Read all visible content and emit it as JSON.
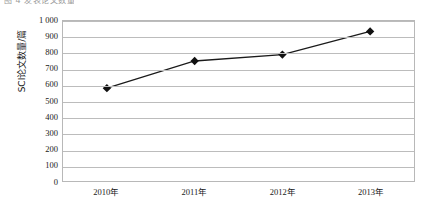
{
  "document": {
    "top_fragment_text": "图 4 发表论文数量"
  },
  "chart_data": {
    "type": "line",
    "title": "",
    "subtitle": "",
    "xlabel": "",
    "ylabel": "SCI论文数量/篇",
    "categories": [
      "2010年",
      "2011年",
      "2012年",
      "2013年"
    ],
    "values": [
      580,
      750,
      790,
      935
    ],
    "series": [
      {
        "name": "SCI论文数量",
        "values": [
          580,
          750,
          790,
          935
        ]
      }
    ],
    "ylim": [
      0,
      1000
    ],
    "ytick_step": 100,
    "ytick_labels": [
      "1 000",
      "900",
      "800",
      "700",
      "600",
      "500",
      "400",
      "300",
      "200",
      "100",
      "0"
    ],
    "ytick_values": [
      1000,
      900,
      800,
      700,
      600,
      500,
      400,
      300,
      200,
      100,
      0
    ],
    "grid": true,
    "grid_axis": "y",
    "legend": false,
    "legend_position": "none",
    "marker": "diamond",
    "colors": {
      "line": "#1a1a1a",
      "marker": "#111111",
      "gridline": "#bcbcbc",
      "axis": "#b8b8b8",
      "background": "#ffffff",
      "text": "#1a1a1a"
    }
  }
}
